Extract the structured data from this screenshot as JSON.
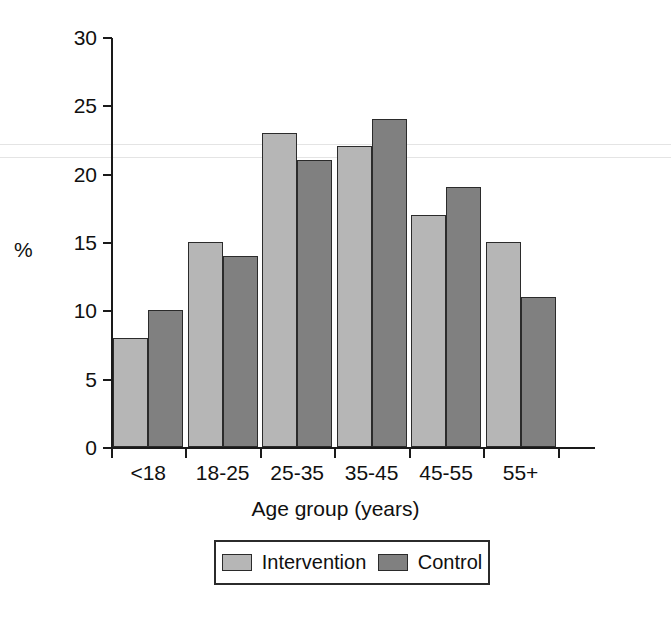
{
  "chart_data": {
    "type": "bar",
    "title": "",
    "xlabel": "Age group (years)",
    "ylabel": "%",
    "categories": [
      "<18",
      "18-25",
      "25-35",
      "35-45",
      "45-55",
      "55+"
    ],
    "series": [
      {
        "name": "Intervention",
        "color": "#b6b6b6",
        "values": [
          8,
          15,
          23,
          22,
          17,
          15
        ]
      },
      {
        "name": "Control",
        "color": "#808080",
        "values": [
          10,
          14,
          21,
          24,
          19,
          11
        ]
      }
    ],
    "ylim": [
      0,
      30
    ],
    "yticks": [
      0,
      5,
      10,
      15,
      20,
      25,
      30
    ],
    "ytick_labels": [
      "0",
      "5",
      "10",
      "15",
      "20",
      "25",
      "30"
    ],
    "grid": false,
    "legend_position": "bottom"
  }
}
